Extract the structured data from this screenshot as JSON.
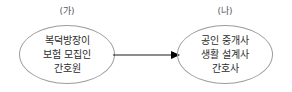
{
  "diagram": {
    "type": "two-node-transformation",
    "background_color": "#ffffff",
    "stroke_color": "#9c9c9c",
    "text_color": "#2b2b2b",
    "label_color": "#575757",
    "groups": [
      {
        "key": "ga",
        "label": "(가)",
        "shape": "ellipse",
        "lines": [
          "복덕방장이",
          "보험 모집인",
          "간호원"
        ]
      },
      {
        "key": "na",
        "label": "(나)",
        "shape": "ellipse",
        "lines": [
          "공인 중개사",
          "생활 설계사",
          "간호사"
        ]
      }
    ],
    "connector": {
      "name": "arrow-right",
      "direction": "left-to-right",
      "style": "solid-line-with-filled-head",
      "color": "#000000",
      "label": ""
    }
  }
}
